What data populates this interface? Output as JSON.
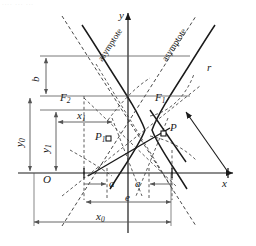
{
  "figure": {
    "type": "geometry-diagram",
    "axis_labels": {
      "x": "x",
      "y": "y",
      "origin": "O"
    },
    "points": [
      {
        "name": "F2",
        "label": "F",
        "sub": "2",
        "role": "left-focus"
      },
      {
        "name": "F1",
        "label": "F",
        "sub": "1",
        "role": "right-focus"
      },
      {
        "name": "P1",
        "label": "P",
        "sub": "1",
        "role": "point-left-branch"
      },
      {
        "name": "P",
        "label": "P",
        "sub": "",
        "role": "point-right-branch"
      }
    ],
    "dimensions": [
      {
        "name": "b",
        "label": "b",
        "sub": "",
        "orientation": "vertical"
      },
      {
        "name": "a-left",
        "label": "a",
        "sub": "",
        "orientation": "horizontal"
      },
      {
        "name": "a-right",
        "label": "a",
        "sub": "",
        "orientation": "horizontal"
      },
      {
        "name": "e",
        "label": "e",
        "sub": "",
        "orientation": "horizontal"
      },
      {
        "name": "x0",
        "label": "x",
        "sub": "0",
        "orientation": "horizontal"
      },
      {
        "name": "x1",
        "label": "x",
        "sub": "1",
        "orientation": "horizontal"
      },
      {
        "name": "y0",
        "label": "y",
        "sub": "0",
        "orientation": "vertical"
      },
      {
        "name": "y1",
        "label": "y",
        "sub": "1",
        "orientation": "vertical"
      },
      {
        "name": "r",
        "label": "r",
        "sub": "",
        "orientation": "oblique"
      }
    ],
    "asymptotes": [
      {
        "name": "asymptote-left",
        "label": "asymptote"
      },
      {
        "name": "asymptote-right",
        "label": "asymptote"
      }
    ],
    "colors": {
      "stroke": "#1a1a1a",
      "dashed": "#333333",
      "dimension": "#555555",
      "background": "#ffffff"
    },
    "top_artifact": "....  ... ..."
  }
}
